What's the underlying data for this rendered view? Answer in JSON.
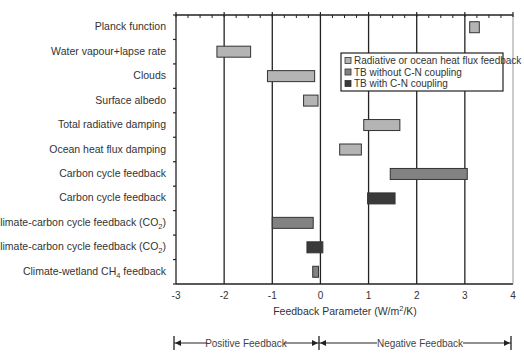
{
  "chart_data": {
    "type": "bar",
    "orientation": "horizontal-floating",
    "title": "",
    "xlabel": "Feedback Parameter (W/m²/K)",
    "ylabel": "",
    "xlim": [
      -3,
      4
    ],
    "xticks": [
      "-3",
      "-2",
      "-1",
      "0",
      "1",
      "2",
      "3",
      "4"
    ],
    "grid": "vertical major gridlines at each integer",
    "legend": {
      "position": "upper right inside plot",
      "entries": [
        {
          "name": "Radiative or ocean heat flux feedback",
          "color": "#b4b4b4"
        },
        {
          "name": "TB without C-N coupling",
          "color": "#828282"
        },
        {
          "name": "TB with C-N coupling",
          "color": "#3a3a3a"
        }
      ]
    },
    "categories": [
      "Planck function",
      "Water vapour+lapse rate",
      "Clouds",
      "Surface albedo",
      "Total radiative damping",
      "Ocean heat flux damping",
      "Carbon cycle feedback",
      "Carbon cycle feedback",
      "Climate-carbon cycle feedback (CO₂)",
      "Climate-carbon cycle feedback (CO₂)",
      "Climate-wetland CH₄ feedback"
    ],
    "bars": [
      {
        "category": "Planck function",
        "series": "Radiative or ocean heat flux feedback",
        "low": 3.1,
        "high": 3.3
      },
      {
        "category": "Water vapour+lapse rate",
        "series": "Radiative or ocean heat flux feedback",
        "low": -2.15,
        "high": -1.45
      },
      {
        "category": "Clouds",
        "series": "Radiative or ocean heat flux feedback",
        "low": -1.1,
        "high": -0.12
      },
      {
        "category": "Surface albedo",
        "series": "Radiative or ocean heat flux feedback",
        "low": -0.35,
        "high": -0.05
      },
      {
        "category": "Total radiative damping",
        "series": "Radiative or ocean heat flux feedback",
        "low": 0.9,
        "high": 1.65
      },
      {
        "category": "Ocean heat flux damping",
        "series": "Radiative or ocean heat flux feedback",
        "low": 0.4,
        "high": 0.85
      },
      {
        "category": "Carbon cycle feedback",
        "series": "TB without C-N coupling",
        "low": 1.45,
        "high": 3.05
      },
      {
        "category": "Carbon cycle feedback",
        "series": "TB with C-N coupling",
        "low": 0.98,
        "high": 1.55
      },
      {
        "category": "Climate-carbon cycle feedback (CO₂)",
        "series": "TB without C-N coupling",
        "low": -1.0,
        "high": -0.15
      },
      {
        "category": "Climate-carbon cycle feedback (CO₂)",
        "series": "TB with C-N coupling",
        "low": -0.28,
        "high": 0.05
      },
      {
        "category": "Climate-wetland CH₄ feedback",
        "series": "TB without C-N coupling",
        "low": -0.16,
        "high": -0.04
      }
    ],
    "annotations": [
      {
        "text": "Positive Feedback",
        "from": -3,
        "to": 0
      },
      {
        "text": "Negative Feedback",
        "from": 0,
        "to": 4
      }
    ]
  },
  "labels": {
    "categories": [
      {
        "main": "Planck function",
        "sub": "",
        "tail": ""
      },
      {
        "main": "Water vapour+lapse rate",
        "sub": "",
        "tail": ""
      },
      {
        "main": "Clouds",
        "sub": "",
        "tail": ""
      },
      {
        "main": "Surface albedo",
        "sub": "",
        "tail": ""
      },
      {
        "main": "Total radiative damping",
        "sub": "",
        "tail": ""
      },
      {
        "main": "Ocean heat flux damping",
        "sub": "",
        "tail": ""
      },
      {
        "main": "Carbon cycle feedback",
        "sub": "",
        "tail": ""
      },
      {
        "main": "Carbon cycle feedback",
        "sub": "",
        "tail": ""
      },
      {
        "main": "Climate-carbon cycle feedback (CO",
        "sub": "2",
        "tail": ")"
      },
      {
        "main": "Climate-carbon cycle feedback (CO",
        "sub": "2",
        "tail": ")"
      },
      {
        "main": "Climate-wetland CH",
        "sub": "4",
        "tail": " feedback"
      }
    ],
    "xaxis_title_pre": "Feedback Parameter (W/m",
    "xaxis_title_sup": "2",
    "xaxis_title_post": "/K)",
    "positive_feedback": "Positive Feedback",
    "negative_feedback": "Negative Feedback"
  }
}
